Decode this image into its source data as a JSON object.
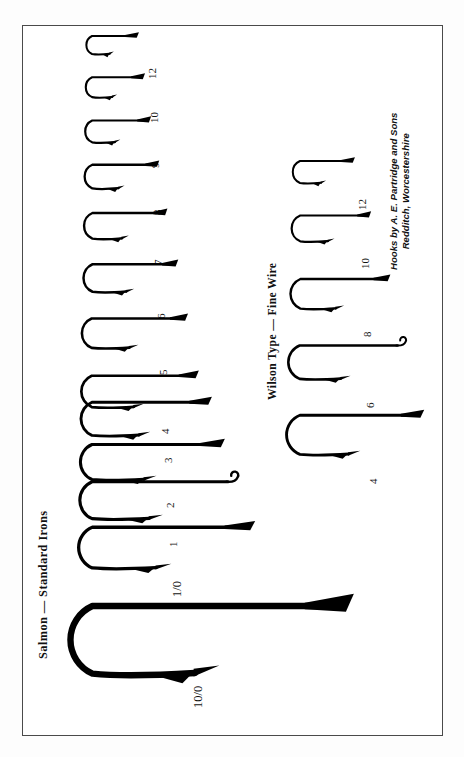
{
  "plate": {
    "background_color": "#ffffff",
    "frame_color": "#4a4a4a",
    "ink_color": "#000000"
  },
  "headings": {
    "salmon": "Salmon — Standard Irons",
    "wilson": "Wilson Type — Fine Wire"
  },
  "credit": {
    "line1": "Hooks by A. E. Partridge and Sons",
    "line2": "Redditch, Worcestershire"
  },
  "chart_data": {
    "type": "table",
    "xlabel": "",
    "ylabel": "",
    "columns": [
      "group",
      "size",
      "shank_length_px",
      "gape_px",
      "wire_px",
      "eye_style"
    ],
    "groups": [
      {
        "name": "Salmon — Standard Irons",
        "hooks": [
          {
            "size": "12",
            "shank_length_px": 42,
            "gape_px": 20,
            "wire_px": 2.0,
            "eye_style": "tapered-spear"
          },
          {
            "size": "10",
            "shank_length_px": 48,
            "gape_px": 22,
            "wire_px": 2.1,
            "eye_style": "tapered-spear"
          },
          {
            "size": "9",
            "shank_length_px": 54,
            "gape_px": 24,
            "wire_px": 2.2,
            "eye_style": "tapered-spear"
          },
          {
            "size": "8",
            "shank_length_px": 62,
            "gape_px": 26,
            "wire_px": 2.3,
            "eye_style": "tapered-spear"
          },
          {
            "size": "7",
            "shank_length_px": 70,
            "gape_px": 28,
            "wire_px": 2.4,
            "eye_style": "tapered-spear"
          },
          {
            "size": "6",
            "shank_length_px": 80,
            "gape_px": 30,
            "wire_px": 2.5,
            "eye_style": "tapered-spear"
          },
          {
            "size": "5",
            "shank_length_px": 90,
            "gape_px": 32,
            "wire_px": 2.6,
            "eye_style": "tapered-spear"
          },
          {
            "size": "4",
            "shank_length_px": 100,
            "gape_px": 34,
            "wire_px": 2.7,
            "eye_style": "tapered-spear"
          },
          {
            "size": "3",
            "shank_length_px": 112,
            "gape_px": 36,
            "wire_px": 2.9,
            "eye_style": "tapered-spear"
          },
          {
            "size": "2",
            "shank_length_px": 124,
            "gape_px": 38,
            "wire_px": 3.0,
            "eye_style": "tapered-spear"
          },
          {
            "size": "1",
            "shank_length_px": 136,
            "gape_px": 40,
            "wire_px": 3.1,
            "eye_style": "looped-up-eye"
          },
          {
            "size": "1/0",
            "shank_length_px": 152,
            "gape_px": 44,
            "wire_px": 3.3,
            "eye_style": "tapered-spear"
          },
          {
            "size": "10/0",
            "shank_length_px": 244,
            "gape_px": 74,
            "wire_px": 6.4,
            "eye_style": "tapered-spear"
          }
        ]
      },
      {
        "name": "Wilson Type — Fine Wire",
        "hooks": [
          {
            "size": "12",
            "shank_length_px": 50,
            "gape_px": 24,
            "wire_px": 2.0,
            "eye_style": "tapered-spear"
          },
          {
            "size": "10",
            "shank_length_px": 66,
            "gape_px": 28,
            "wire_px": 2.2,
            "eye_style": "tapered-spear"
          },
          {
            "size": "8",
            "shank_length_px": 84,
            "gape_px": 32,
            "wire_px": 2.4,
            "eye_style": "tapered-spear"
          },
          {
            "size": "6",
            "shank_length_px": 98,
            "gape_px": 36,
            "wire_px": 2.6,
            "eye_style": "looped-up-eye"
          },
          {
            "size": "4",
            "shank_length_px": 116,
            "gape_px": 42,
            "wire_px": 2.9,
            "eye_style": "tapered-spear"
          }
        ]
      }
    ]
  },
  "salmon_sizes": [
    "12",
    "10",
    "9",
    "8",
    "7",
    "6",
    "5",
    "4",
    "3",
    "2",
    "1",
    "1/0",
    "10/0"
  ],
  "wilson_sizes": [
    "12",
    "10",
    "8",
    "6",
    "4"
  ]
}
